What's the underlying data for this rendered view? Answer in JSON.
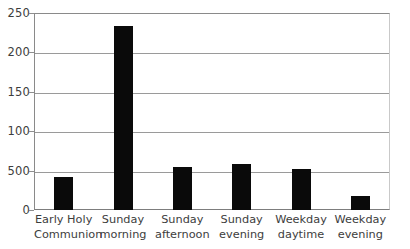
{
  "chart_data": {
    "type": "bar",
    "title": "",
    "subtitle": "",
    "xlabel": "",
    "ylabel": "",
    "categories": [
      "Early Holy Communion",
      "Sunday morning",
      "Sunday afternoon",
      "Sunday evening",
      "Weekday daytime",
      "Weekday evening"
    ],
    "category_lines": [
      [
        "Early Holy",
        "Communion"
      ],
      [
        "Sunday",
        "morning"
      ],
      [
        "Sunday",
        "afternoon"
      ],
      [
        "Sunday",
        "evening"
      ],
      [
        "Weekday",
        "daytime"
      ],
      [
        "Weekday",
        "evening"
      ]
    ],
    "values": [
      42,
      233,
      55,
      59,
      52,
      18
    ],
    "ylim": [
      0,
      250
    ],
    "ytick_values": [
      250,
      200,
      150,
      100,
      50,
      0
    ],
    "ytick_labels": [
      "250",
      "200",
      "150",
      "100",
      "500",
      "0"
    ],
    "grid": true,
    "grid_axis": "y",
    "legend": "none",
    "bar_color": "#0a0a0a",
    "grid_color": "#9a9a9a",
    "axis_color": "#8a8a8a",
    "background_color": "#ffffff"
  }
}
